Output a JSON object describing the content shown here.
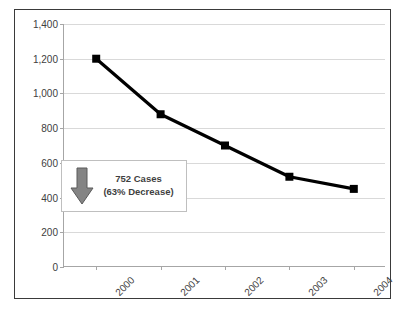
{
  "chart_data": {
    "type": "line",
    "title": "",
    "xlabel": "",
    "ylabel": "",
    "categories": [
      "2000",
      "2001",
      "2002",
      "2003",
      "2004"
    ],
    "values": [
      1200,
      880,
      700,
      520,
      450
    ],
    "series": [
      {
        "name": "Cases",
        "values": [
          1200,
          880,
          700,
          520,
          450
        ]
      }
    ],
    "ylim": [
      0,
      1400
    ],
    "yticks": [
      0,
      200,
      400,
      600,
      800,
      1000,
      1200,
      1400
    ],
    "ytick_labels": [
      "0",
      "200",
      "400",
      "600",
      "800",
      "1,000",
      "1,200",
      "1,400"
    ],
    "grid": true,
    "legend": false,
    "marker": "square",
    "line_color": "#000000",
    "marker_color": "#000000",
    "gridline_color": "#d9d9d9",
    "annotations": [
      {
        "line1": "752 Cases",
        "line2": "(63% Decrease)",
        "icon": "down-arrow",
        "icon_color": "#808080"
      }
    ]
  },
  "callout": {
    "line1": "752 Cases",
    "line2": "(63% Decrease)"
  }
}
